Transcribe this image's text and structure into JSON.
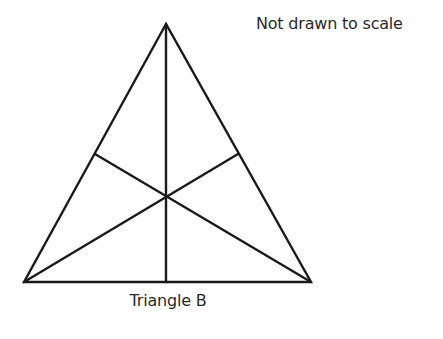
{
  "note": "Not drawn to scale",
  "caption": "Triangle B",
  "colors": {
    "line": "#1a1a1a",
    "text": "#2a2a2a",
    "background": "#ffffff"
  },
  "triangle": {
    "apex": [
      166,
      24
    ],
    "base_left": [
      24,
      282
    ],
    "base_right": [
      311,
      282
    ],
    "lines": [
      "median from apex to base midpoint",
      "line from base-left vertex to right side",
      "line from base-right vertex to left side"
    ],
    "intersection_point": [
      166,
      197
    ]
  }
}
